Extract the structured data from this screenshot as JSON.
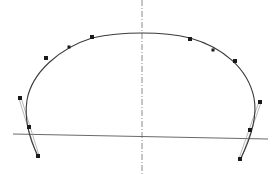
{
  "diagram": {
    "colors": {
      "background": "#ffffff",
      "curve": "#3a3a3a",
      "points": "#1a1a1a",
      "axis": "#8a8a8a",
      "baseline": "#6a6a6a",
      "tangent": "#9a9a9a"
    },
    "symmetry_axis": {
      "x": 142,
      "y1": 0,
      "y2": 174,
      "style": "dash-dot"
    },
    "baseline": {
      "x1": 13,
      "y1": 134,
      "x2": 268,
      "y2": 139
    },
    "curve_path": "M 38 156 C 30 140, 24 120, 27 100 C 32 72, 60 48, 92 38 C 110 34, 128 33, 142 33 C 160 33, 178 35, 190 38 C 222 47, 248 68, 254 98 C 258 118, 250 140, 240 160",
    "points": [
      {
        "id": "L1",
        "x": 38,
        "y": 156,
        "size": "large"
      },
      {
        "id": "L2",
        "x": 29,
        "y": 127,
        "size": "large"
      },
      {
        "id": "L3",
        "x": 20,
        "y": 98,
        "size": "large"
      },
      {
        "id": "L4",
        "x": 46,
        "y": 58,
        "size": "large"
      },
      {
        "id": "L5",
        "x": 69,
        "y": 47,
        "size": "small"
      },
      {
        "id": "L6",
        "x": 92,
        "y": 37,
        "size": "large"
      },
      {
        "id": "R6",
        "x": 190,
        "y": 39,
        "size": "large"
      },
      {
        "id": "R5",
        "x": 213,
        "y": 50,
        "size": "small"
      },
      {
        "id": "R4",
        "x": 235,
        "y": 61,
        "size": "large"
      },
      {
        "id": "R3",
        "x": 260,
        "y": 102,
        "size": "large"
      },
      {
        "id": "R2",
        "x": 250,
        "y": 130,
        "size": "large"
      },
      {
        "id": "R1",
        "x": 240,
        "y": 159,
        "size": "large"
      }
    ],
    "tangents": [
      {
        "id": "left-tangent",
        "x1": 20,
        "y1": 98,
        "x2": 38,
        "y2": 156
      },
      {
        "id": "right-tangent",
        "x1": 260,
        "y1": 102,
        "x2": 240,
        "y2": 159
      }
    ]
  }
}
